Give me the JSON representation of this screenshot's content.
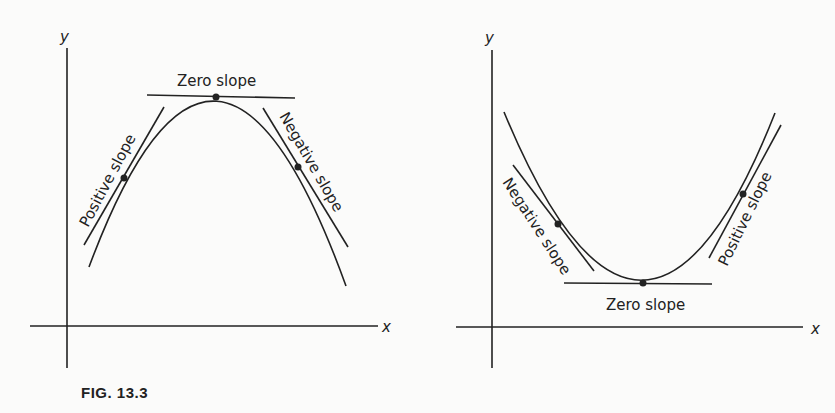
{
  "figure": {
    "caption": "FIG. 13.3",
    "panels": [
      {
        "name": "maximum",
        "y_axis_label": "y",
        "x_axis_label": "x",
        "labels": {
          "left_tangent": "Positive slope",
          "top_tangent": "Zero slope",
          "right_tangent": "Negative slope"
        }
      },
      {
        "name": "minimum",
        "y_axis_label": "y",
        "x_axis_label": "x",
        "labels": {
          "left_tangent": "Negative slope",
          "bottom_tangent": "Zero slope",
          "right_tangent": "Positive slope"
        }
      }
    ]
  },
  "colors": {
    "ink": "#222222",
    "paper": "#fbfbfa"
  }
}
